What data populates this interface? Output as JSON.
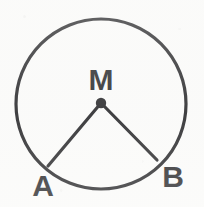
{
  "figure": {
    "kind": "geometry-diagram",
    "background_color": "#fbfbfa",
    "stroke_color": "#17171a",
    "label_color": "#17171a",
    "canvas": {
      "width": 204,
      "height": 207
    },
    "circle": {
      "center_x": 101,
      "center_y": 104,
      "radius": 85,
      "stroke_width": 3.2
    },
    "center_point": {
      "x": 101,
      "y": 103,
      "radius": 5.2
    },
    "radii": [
      {
        "name": "radius-m-a",
        "x1": 101,
        "y1": 103,
        "x2": 48,
        "y2": 166,
        "stroke_width": 3.2
      },
      {
        "name": "radius-m-b",
        "x1": 101,
        "y1": 103,
        "x2": 157,
        "y2": 160,
        "stroke_width": 3.2
      }
    ],
    "labels": [
      {
        "name": "label-m",
        "text": "M",
        "x": 101,
        "y": 90,
        "anchor": "middle",
        "font_size": 30
      },
      {
        "name": "label-a",
        "text": "A",
        "x": 43,
        "y": 196,
        "anchor": "middle",
        "font_size": 30
      },
      {
        "name": "label-b",
        "text": "B",
        "x": 173,
        "y": 187,
        "anchor": "middle",
        "font_size": 30
      }
    ]
  }
}
